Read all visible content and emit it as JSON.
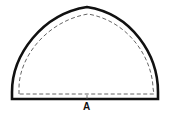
{
  "diagram": {
    "type": "pattern-piece",
    "shape": "pointed-arch half-dome",
    "outline": "solid cutting line",
    "seam": "dashed stitching line",
    "label": "A",
    "colors": {
      "line": "#111111",
      "background": "#ffffff"
    }
  }
}
